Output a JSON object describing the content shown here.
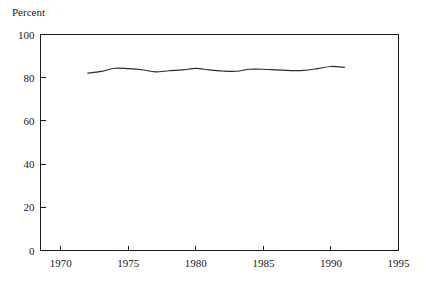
{
  "chart_data": {
    "type": "line",
    "title": "Percent",
    "xlabel": "",
    "ylabel": "Percent",
    "xlim": [
      1968.5,
      1995.0
    ],
    "ylim": [
      0,
      100
    ],
    "grid": false,
    "legend": false,
    "legend_position": "none",
    "x_ticks": [
      1970,
      1975,
      1980,
      1985,
      1990,
      1995
    ],
    "x_tick_labels": [
      "1970",
      "1975",
      "1980",
      "1985",
      "1990",
      "1995"
    ],
    "y_ticks": [
      0,
      20,
      40,
      60,
      80,
      100
    ],
    "y_tick_labels": [
      "0",
      "20",
      "40",
      "60",
      "80",
      "100"
    ],
    "tick_direction": "in",
    "frame": "box",
    "line_color": "#2b2b2b",
    "background_color": "#ffffff",
    "series": [
      {
        "name": "Percent",
        "x": [
          1972,
          1973,
          1974,
          1975,
          1976,
          1977,
          1978,
          1979,
          1980,
          1981,
          1982,
          1983,
          1984,
          1985,
          1986,
          1987,
          1988,
          1989,
          1990,
          1991
        ],
        "values": [
          82.1,
          82.9,
          84.4,
          84.2,
          83.7,
          82.7,
          83.2,
          83.6,
          84.3,
          83.6,
          83.1,
          83.0,
          83.9,
          83.9,
          83.6,
          83.3,
          83.4,
          84.2,
          85.2,
          84.8
        ]
      }
    ],
    "annotations": []
  },
  "chart": {
    "title_label": "Percent"
  }
}
